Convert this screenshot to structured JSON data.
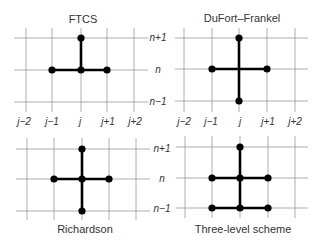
{
  "colors": {
    "grid": "#9a9a9a",
    "stencil": "#000000",
    "text": "#333333",
    "background": "#ffffff"
  },
  "j_labels": [
    "j−2",
    "j−1",
    "j",
    "j+1",
    "j+2"
  ],
  "n_labels": [
    "n+1",
    "n",
    "n−1"
  ],
  "panels": [
    {
      "id": "ftcs",
      "title": "FTCS",
      "title_pos": [
        83,
        23
      ],
      "x": [
        26,
        52,
        81,
        107,
        134
      ],
      "y": [
        38,
        70,
        102
      ],
      "grid_x_extent": [
        14,
        148
      ],
      "grid_y_extent": [
        28,
        112
      ],
      "segments": [
        [
          [
            1,
            1
          ],
          [
            3,
            1
          ]
        ],
        [
          [
            2,
            0
          ],
          [
            2,
            1
          ]
        ]
      ],
      "nodes": [
        [
          2,
          0
        ],
        [
          1,
          1
        ],
        [
          2,
          1
        ],
        [
          3,
          1
        ]
      ]
    },
    {
      "id": "dufort-frankel",
      "title": "DuFort–Frankel",
      "title_pos": [
        242,
        22
      ],
      "x": [
        184,
        212,
        239,
        267,
        295
      ],
      "y": [
        38,
        69,
        101
      ],
      "grid_x_extent": [
        175,
        308
      ],
      "grid_y_extent": [
        28,
        112
      ],
      "segments": [
        [
          [
            1,
            1
          ],
          [
            3,
            1
          ]
        ],
        [
          [
            2,
            0
          ],
          [
            2,
            2
          ]
        ]
      ],
      "nodes": [
        [
          2,
          0
        ],
        [
          1,
          1
        ],
        [
          3,
          1
        ],
        [
          2,
          2
        ]
      ]
    },
    {
      "id": "richardson",
      "title": "Richardson",
      "title_pos": [
        85,
        233
      ],
      "x": [
        27,
        54,
        82,
        109,
        136
      ],
      "y": [
        149,
        179,
        211
      ],
      "grid_x_extent": [
        16,
        150
      ],
      "grid_y_extent": [
        138,
        220
      ],
      "segments": [
        [
          [
            1,
            1
          ],
          [
            3,
            1
          ]
        ],
        [
          [
            2,
            0
          ],
          [
            2,
            2
          ]
        ]
      ],
      "nodes": [
        [
          2,
          0
        ],
        [
          1,
          1
        ],
        [
          2,
          1
        ],
        [
          3,
          1
        ],
        [
          2,
          2
        ]
      ]
    },
    {
      "id": "three-level",
      "title": "Three-level scheme",
      "title_pos": [
        243,
        233
      ],
      "x": [
        185,
        212,
        240,
        268,
        295
      ],
      "y": [
        147,
        178,
        208
      ],
      "grid_x_extent": [
        176,
        308
      ],
      "grid_y_extent": [
        136,
        218
      ],
      "segments": [
        [
          [
            1,
            1
          ],
          [
            3,
            1
          ]
        ],
        [
          [
            1,
            2
          ],
          [
            3,
            2
          ]
        ],
        [
          [
            2,
            0
          ],
          [
            2,
            2
          ]
        ]
      ],
      "nodes": [
        [
          2,
          0
        ],
        [
          1,
          1
        ],
        [
          2,
          1
        ],
        [
          3,
          1
        ],
        [
          1,
          2
        ],
        [
          2,
          2
        ],
        [
          3,
          2
        ]
      ]
    }
  ],
  "j_label_rows": [
    {
      "y": 125,
      "x": [
        24,
        52,
        80,
        108,
        135
      ]
    },
    {
      "y": 125,
      "x": [
        184,
        211,
        240,
        268,
        295
      ]
    }
  ],
  "n_label_cols": [
    {
      "x": 158,
      "y": [
        41,
        73,
        105
      ]
    },
    {
      "x": 162,
      "y": [
        152,
        182,
        212
      ]
    }
  ]
}
